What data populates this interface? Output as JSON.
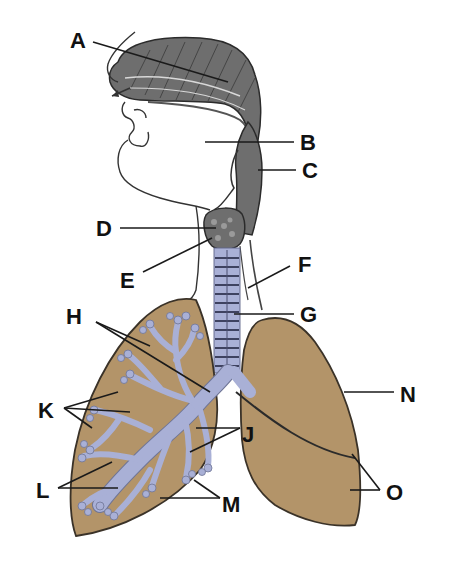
{
  "diagram": {
    "colors": {
      "lung_tissue": "#b39469",
      "airways": "#a9b0d6",
      "head_sketch": "#6e6e6e",
      "outline": "#3a3228",
      "label_text": "#111111"
    },
    "labels": [
      {
        "id": "A",
        "text": "A",
        "points_to": "nasal cavity"
      },
      {
        "id": "B",
        "text": "B",
        "points_to": "oral cavity / pharynx region"
      },
      {
        "id": "C",
        "text": "C",
        "points_to": "pharynx"
      },
      {
        "id": "D",
        "text": "D",
        "points_to": "epiglottis region"
      },
      {
        "id": "E",
        "text": "E",
        "points_to": "larynx"
      },
      {
        "id": "F",
        "text": "F",
        "points_to": "oesophagus"
      },
      {
        "id": "G",
        "text": "G",
        "points_to": "trachea"
      },
      {
        "id": "H",
        "text": "H",
        "points_to": "bronchi"
      },
      {
        "id": "J",
        "text": "J",
        "points_to": "bronchioles"
      },
      {
        "id": "K",
        "text": "K",
        "points_to": "alveoli"
      },
      {
        "id": "L",
        "text": "L",
        "points_to": "bronchioles (left lung branches)"
      },
      {
        "id": "M",
        "text": "M",
        "points_to": "alveolar sacs"
      },
      {
        "id": "N",
        "text": "N",
        "points_to": "pleural membrane / lung surface"
      },
      {
        "id": "O",
        "text": "O",
        "points_to": "lung lobes"
      }
    ]
  }
}
